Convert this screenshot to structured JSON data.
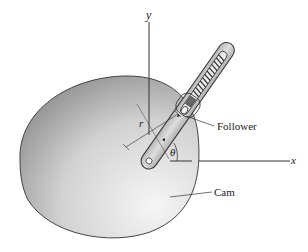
{
  "figure": {
    "labels": {
      "y_axis": "y",
      "x_axis": "x",
      "radius": "r",
      "angle": "θ",
      "follower": "Follower",
      "cam": "Cam"
    },
    "colors": {
      "cam_light": "#f4f4f4",
      "cam_dark": "#8f8f8f",
      "arm_fill": "#c8c8c8",
      "outline": "#333333"
    }
  }
}
